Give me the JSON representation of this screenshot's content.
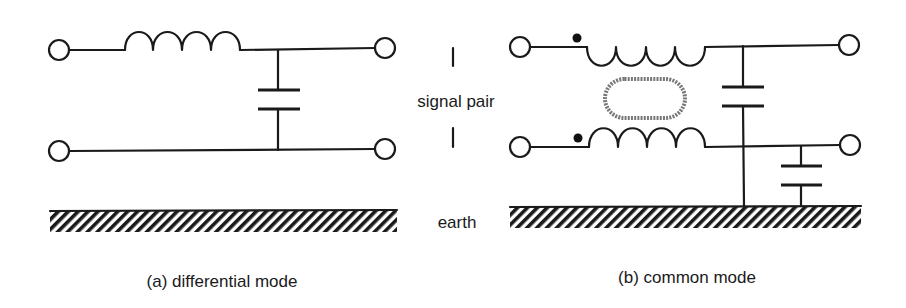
{
  "labels": {
    "signal_pair": "signal pair",
    "earth": "earth",
    "caption_a": "(a) differential mode",
    "caption_b": "(b) common mode"
  },
  "colors": {
    "ink": "#1a1a1a",
    "core": "#777777",
    "background": "#ffffff"
  },
  "circuits": [
    {
      "id": "a",
      "name": "differential mode filter",
      "components": [
        "series inductor on top line",
        "capacitor between lines",
        "earth plane (unconnected)"
      ],
      "terminals": 4
    },
    {
      "id": "b",
      "name": "common mode filter",
      "components": [
        "coupled inductors (common-mode choke) with dot markings",
        "magnetic core",
        "capacitor top line to earth",
        "capacitor bottom line to earth",
        "earth plane"
      ],
      "terminals": 4
    }
  ]
}
